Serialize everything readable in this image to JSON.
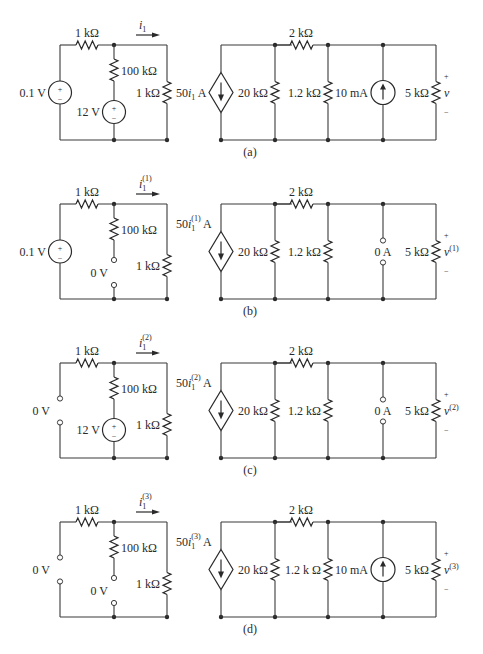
{
  "figure": {
    "panels": [
      {
        "id": "a",
        "caption": "(a)",
        "y_top": 45,
        "y_bot": 140,
        "left_source": {
          "type": "voltage",
          "label": "0.1 V"
        },
        "mid_source": {
          "type": "voltage",
          "label": "12 V"
        },
        "right_source": {
          "type": "current",
          "label": "10 mA"
        },
        "current_label": {
          "base": "i",
          "sub": "1",
          "sup": ""
        },
        "dep_label": {
          "prefix": "50",
          "base": "i",
          "sub": "1",
          "sup": "",
          "suffix": " A"
        },
        "out_label": {
          "base": "v",
          "sup": ""
        },
        "r_1200_label": "1.2 kΩ"
      },
      {
        "id": "b",
        "caption": "(b)",
        "y_top": 204,
        "y_bot": 299,
        "left_source": {
          "type": "voltage",
          "label": "0.1 V"
        },
        "mid_source": {
          "type": "short",
          "label": "0 V"
        },
        "right_source": {
          "type": "open",
          "label": "0 A"
        },
        "current_label": {
          "base": "i",
          "sub": "1",
          "sup": "(1)"
        },
        "dep_label": {
          "prefix": "50",
          "base": "i",
          "sub": "1",
          "sup": "(1)",
          "suffix": " A"
        },
        "out_label": {
          "base": "v",
          "sup": "(1)"
        },
        "r_1200_label": "1.2 kΩ"
      },
      {
        "id": "c",
        "caption": "(c)",
        "y_top": 363,
        "y_bot": 458,
        "left_source": {
          "type": "short",
          "label": "0 V"
        },
        "mid_source": {
          "type": "voltage",
          "label": "12 V"
        },
        "right_source": {
          "type": "open",
          "label": "0 A"
        },
        "current_label": {
          "base": "i",
          "sub": "1",
          "sup": "(2)"
        },
        "dep_label": {
          "prefix": "50",
          "base": "i",
          "sub": "1",
          "sup": "(2)",
          "suffix": " A"
        },
        "out_label": {
          "base": "v",
          "sup": "(2)"
        },
        "r_1200_label": "1.2 kΩ"
      },
      {
        "id": "d",
        "caption": "(d)",
        "y_top": 522,
        "y_bot": 617,
        "left_source": {
          "type": "short",
          "label": "0 V"
        },
        "mid_source": {
          "type": "short",
          "label": "0 V"
        },
        "right_source": {
          "type": "current",
          "label": "10 mA"
        },
        "current_label": {
          "base": "i",
          "sub": "1",
          "sup": "(3)"
        },
        "dep_label": {
          "prefix": "50",
          "base": "i",
          "sub": "1",
          "sup": "(3)",
          "suffix": " A"
        },
        "out_label": {
          "base": "v",
          "sup": "(3)"
        },
        "r_1200_label": "1.2 k Ω"
      }
    ],
    "resistors": {
      "r_series_left": "1 kΩ",
      "r_100k": "100 kΩ",
      "r_1k_shunt": "1 kΩ",
      "r_2k": "2 kΩ",
      "r_20k": "20 kΩ",
      "r_5k": "5 kΩ"
    },
    "polarity": {
      "plus": "+",
      "minus": "−"
    },
    "colors": {
      "ink": "#2a2a2a",
      "background": "#ffffff"
    }
  }
}
